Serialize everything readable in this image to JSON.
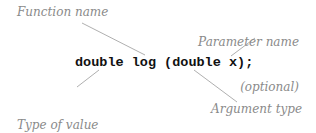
{
  "code": {
    "text": "double log (double x);"
  },
  "annotations": {
    "function_name": "Function name",
    "parameter_name_line1": "Parameter name",
    "parameter_name_line2": "(optional)",
    "return_type_line1": "Type of value",
    "return_type_line2": "returned by",
    "return_type_line3": "function",
    "argument_type": "Argument type"
  },
  "colors": {
    "annotation_text": "#8a8a8a",
    "leader_line": "#9a9a9a",
    "code_text": "#111111"
  }
}
